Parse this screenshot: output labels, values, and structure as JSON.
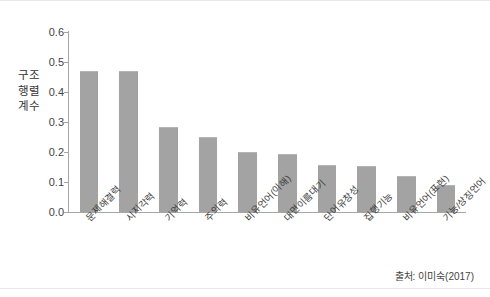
{
  "figure": {
    "background_color": "#ffffff",
    "bar_color": "#a3a3a3",
    "axis_color": "#a6a6a6",
    "source_note": "출처: 이미숙(2017)"
  },
  "chart_data": {
    "type": "bar",
    "title": "",
    "xlabel": "",
    "ylabel": "구조\n행렬\n계수",
    "ylabel_text": "구조행렬 계수",
    "ylim": [
      0.0,
      0.6
    ],
    "ytick_labels": [
      "0.6",
      "0.5",
      "0.4",
      "0.3",
      "0.2",
      "0.1",
      "0.0"
    ],
    "ytick_values": [
      0.6,
      0.5,
      0.4,
      0.3,
      0.2,
      0.1,
      0.0
    ],
    "grid": false,
    "legend": null,
    "categories": [
      "문제해결력",
      "시지각력",
      "기억력",
      "주의력",
      "비유언어(이해)",
      "대면이름대기",
      "단어유창성",
      "집행기능",
      "비유언어(표현)",
      "기능/상징언어"
    ],
    "values": [
      0.47,
      0.47,
      0.285,
      0.25,
      0.2,
      0.195,
      0.157,
      0.152,
      0.12,
      0.09
    ]
  }
}
